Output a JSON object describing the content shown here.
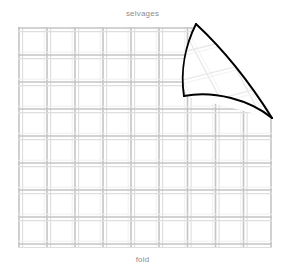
{
  "figure": {
    "title_top": "selvages",
    "title_bottom": "fold",
    "background_color": "#ffffff",
    "label_color": "#8c8c8c"
  },
  "fabric": {
    "description": "plaid fabric swatch with folded-back corner",
    "plaid_color_strong": "#c4c4c4",
    "plaid_color_faint": "#e2e2e2",
    "plaid_color_ghost": "#ededed",
    "outline_color": "#000000",
    "underside_color": "#ffffff",
    "area": {
      "x": 18,
      "y": 27,
      "width": 254,
      "height": 221
    },
    "vertical_lines": [
      18,
      46,
      74,
      102,
      130,
      158,
      187,
      215,
      243,
      271
    ],
    "horizontal_lines": [
      27,
      54,
      81,
      108,
      135,
      162,
      189,
      216,
      243
    ],
    "band_offset": 3,
    "band_width_strong": 1.6,
    "band_width_faint": 1.0
  },
  "curl": {
    "apex": {
      "x": 196,
      "y": 24
    },
    "left_vertex": {
      "x": 184,
      "y": 96
    },
    "right_tip": {
      "x": 272,
      "y": 118
    },
    "stroke_width": 1.9,
    "underside_grid_opacity": 0.5
  }
}
